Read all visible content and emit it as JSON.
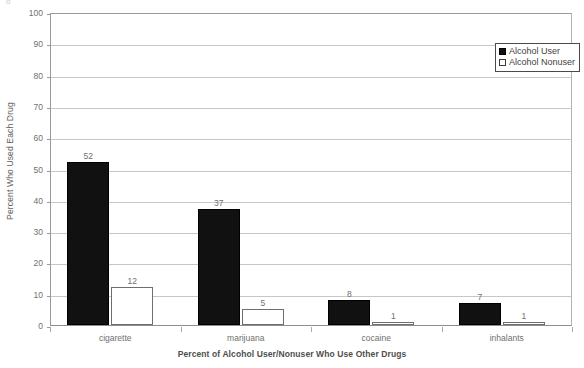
{
  "chart_data": {
    "type": "bar",
    "title": "",
    "xlabel": "Percent of Alcohol User/Nonuser Who Use Other Drugs",
    "ylabel": "Percent Who Used Each Drug",
    "categories": [
      "cigarette",
      "marijuana",
      "cocaine",
      "inhalants"
    ],
    "series": [
      {
        "name": "Alcohol User",
        "values": [
          52,
          37,
          8,
          7
        ],
        "color": "#111111",
        "fill": "solid"
      },
      {
        "name": "Alcohol Nonuser",
        "values": [
          12,
          5,
          1,
          1
        ],
        "color": "#ffffff",
        "fill": "hollow"
      }
    ],
    "ylim": [
      0,
      100
    ],
    "yticks": [
      0,
      10,
      20,
      30,
      40,
      50,
      60,
      70,
      80,
      90,
      100
    ],
    "ytick_labels": [
      "0",
      "10",
      "20",
      "30",
      "40",
      "50",
      "60",
      "70",
      "80",
      "90",
      "100"
    ],
    "grid": true,
    "grid_axis": "y",
    "legend_position": "top-right",
    "data_labels": true
  },
  "artifacts": {
    "top_left_speck": "o",
    "mid_speck": "·"
  }
}
